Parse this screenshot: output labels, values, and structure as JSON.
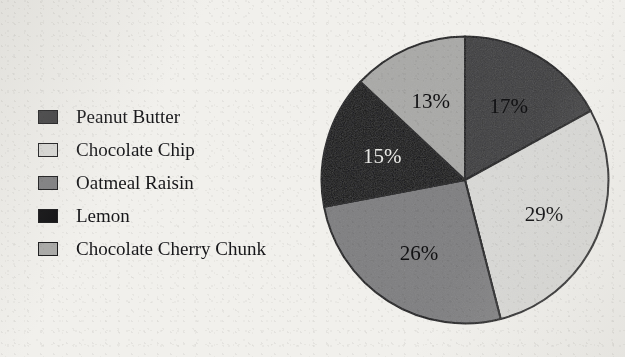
{
  "title": "",
  "background_color": "#f1f0ec",
  "outline_color": "#18181a",
  "legend": {
    "items": [
      {
        "label": "Peanut Butter",
        "color": "#3c3c3e"
      },
      {
        "label": "Chocolate Chip",
        "color": "#d9d9d6"
      },
      {
        "label": "Oatmeal Raisin",
        "color": "#7e7e80"
      },
      {
        "label": "Lemon",
        "color": "#0e0e10"
      },
      {
        "label": "Chocolate Cherry Chunk",
        "color": "#a9a9a7"
      }
    ]
  },
  "chart_data": {
    "type": "pie",
    "title": "",
    "categories": [
      "Peanut Butter",
      "Chocolate Chip",
      "Oatmeal Raisin",
      "Lemon",
      "Chocolate Cherry Chunk"
    ],
    "values": [
      17,
      29,
      26,
      15,
      13
    ],
    "unit": "%",
    "labels": [
      "17%",
      "29%",
      "26%",
      "15%",
      "13%"
    ],
    "colors": [
      "#3c3c3e",
      "#d9d9d6",
      "#7e7e80",
      "#0e0e10",
      "#a9a9a7"
    ],
    "label_text_colors": [
      "#111113",
      "#111113",
      "#111113",
      "#e9e9e6",
      "#111113"
    ],
    "start_angle_deg": 0,
    "direction": "clockwise",
    "legend_position": "left",
    "grid": false,
    "total": 100
  }
}
